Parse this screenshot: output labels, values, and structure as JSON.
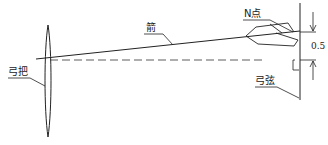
{
  "diagram": {
    "labels": {
      "bow_grip": "弓把",
      "arrow": "箭",
      "n_point": "N点",
      "bowstring": "弓弦"
    },
    "dimension": {
      "value": "0.5"
    },
    "colors": {
      "line": "#222222",
      "background": "#ffffff"
    }
  }
}
